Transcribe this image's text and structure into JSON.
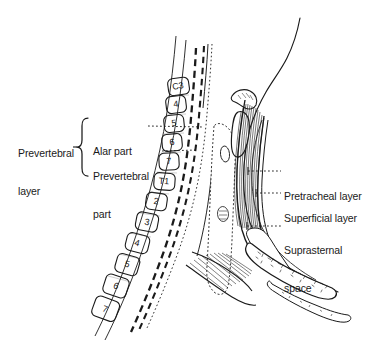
{
  "figure": {
    "background_color": "#ffffff",
    "ink_color": "#1a1a1a",
    "width": 374,
    "height": 350
  },
  "labels_left": {
    "bracket_label": {
      "name": "prevertebral-layer",
      "line1": "Prevertebral",
      "line2": "layer",
      "x": 18,
      "y": 128
    },
    "sub_labels": [
      {
        "name": "alar-part",
        "line1": "Alar part",
        "line2": "",
        "x": 93,
        "y": 121,
        "leader_from_x": 148,
        "leader_from_y": 126,
        "leader_to_x": 200,
        "leader_to_y": 127
      },
      {
        "name": "prevertebral-part",
        "line1": "Prevertebral",
        "line2": "part",
        "x": 93,
        "y": 147,
        "leader_from_x": 162,
        "leader_from_y": 152,
        "leader_to_x": 202,
        "leader_to_y": 150
      }
    ]
  },
  "labels_right": [
    {
      "name": "pretracheal-layer",
      "line1": "Pretracheal layer",
      "line2": "",
      "x": 284,
      "y": 166,
      "leader_from_x": 248,
      "leader_from_y": 172,
      "leader_to_x": 281,
      "leader_to_y": 172
    },
    {
      "name": "superficial-layer",
      "line1": "Superficial layer",
      "line2": "",
      "x": 284,
      "y": 188,
      "leader_from_x": 254,
      "leader_from_y": 194,
      "leader_to_x": 281,
      "leader_to_y": 194
    },
    {
      "name": "suprasternal-space",
      "line1": "Suprasternal",
      "line2": "space",
      "x": 284,
      "y": 220,
      "leader_from_x": 246,
      "leader_from_y": 226,
      "leader_to_x": 281,
      "leader_to_y": 226
    }
  ],
  "vertebrae": [
    {
      "label": "C3",
      "x": 178,
      "y": 86,
      "w": 20,
      "h": 17,
      "rot": -8
    },
    {
      "label": "4",
      "x": 176,
      "y": 104,
      "w": 19,
      "h": 17,
      "rot": -7
    },
    {
      "label": "5",
      "x": 174,
      "y": 123,
      "w": 19,
      "h": 17,
      "rot": -6
    },
    {
      "label": "6",
      "x": 172,
      "y": 142,
      "w": 19,
      "h": 17,
      "rot": -5
    },
    {
      "label": "7",
      "x": 169,
      "y": 161,
      "w": 19,
      "h": 17,
      "rot": -3
    },
    {
      "label": "T1",
      "x": 164,
      "y": 181,
      "w": 20,
      "h": 17,
      "rot": 4
    },
    {
      "label": "2",
      "x": 156,
      "y": 201,
      "w": 20,
      "h": 17,
      "rot": 8
    },
    {
      "label": "3",
      "x": 147,
      "y": 222,
      "w": 21,
      "h": 18,
      "rot": 11
    },
    {
      "label": "4",
      "x": 137,
      "y": 243,
      "w": 22,
      "h": 18,
      "rot": 14
    },
    {
      "label": "5",
      "x": 127,
      "y": 264,
      "w": 22,
      "h": 19,
      "rot": 16
    },
    {
      "label": "6",
      "x": 116,
      "y": 286,
      "w": 23,
      "h": 20,
      "rot": 18
    },
    {
      "label": "7",
      "x": 105,
      "y": 309,
      "w": 24,
      "h": 21,
      "rot": 20
    }
  ],
  "structures": [
    {
      "name": "head-neck-profile-outline"
    },
    {
      "name": "mandible-chin-curve"
    },
    {
      "name": "vertebral-column"
    },
    {
      "name": "alar-fascia-dashed-line"
    },
    {
      "name": "prevertebral-fascia-dashed-line"
    },
    {
      "name": "pharyngeal-wall"
    },
    {
      "name": "hyoid-bone"
    },
    {
      "name": "thyroid-cartilage"
    },
    {
      "name": "trachea"
    },
    {
      "name": "infrahyoid-strap-muscles"
    },
    {
      "name": "investing-fascia"
    },
    {
      "name": "manubrium-sternum"
    },
    {
      "name": "suprasternal-space-cavity"
    }
  ]
}
